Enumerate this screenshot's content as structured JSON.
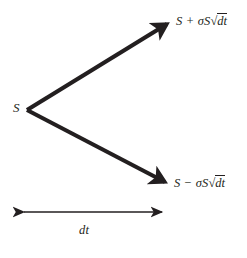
{
  "diagram": {
    "type": "binomial-tree",
    "background_color": "#ffffff",
    "stroke_color": "#231f20",
    "text_color": "#231f20",
    "nodes": {
      "origin_label": "S",
      "up_label_prefix": "S + σS",
      "up_label_radicand": "dt",
      "down_label_prefix": "S − σS",
      "down_label_radicand": "dt",
      "up_label_full": "S + σS√dt",
      "down_label_full": "S − σS√dt"
    },
    "time_axis": {
      "label": "dt",
      "start_x": 19,
      "end_x": 167,
      "y": 212
    },
    "arrows": [
      {
        "name": "up-branch",
        "from_x": 27,
        "from_y": 110,
        "to_x": 171,
        "to_y": 21,
        "stroke_width": 4.2
      },
      {
        "name": "down-branch",
        "from_x": 27,
        "from_y": 110,
        "to_x": 169,
        "to_y": 185,
        "stroke_width": 4.2
      }
    ]
  }
}
